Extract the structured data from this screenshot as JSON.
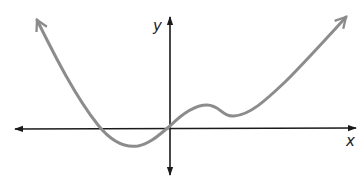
{
  "figure": {
    "type": "function-graph",
    "axes": {
      "x_label": "x",
      "y_label": "y",
      "axis_color": "#1a1a1a",
      "curve_color": "#8c8c8c"
    },
    "curve": {
      "description": "Polynomial-like curve, arrows on both ends; decreases from upper-left, crosses x-axis, local minimum below x-axis left of origin, passes through origin, small local max and min above x-axis to the right of origin, then rises to upper-right.",
      "features": [
        {
          "name": "left-end-arrow",
          "direction": "up-left"
        },
        {
          "name": "x-intercept-left",
          "position": "left of origin"
        },
        {
          "name": "local-minimum",
          "position": "left of origin, below x-axis"
        },
        {
          "name": "passes-origin"
        },
        {
          "name": "local-maximum",
          "position": "right of origin, above x-axis"
        },
        {
          "name": "local-minimum-2",
          "position": "right of origin, above x-axis"
        },
        {
          "name": "right-end-arrow",
          "direction": "up-right"
        }
      ]
    }
  }
}
